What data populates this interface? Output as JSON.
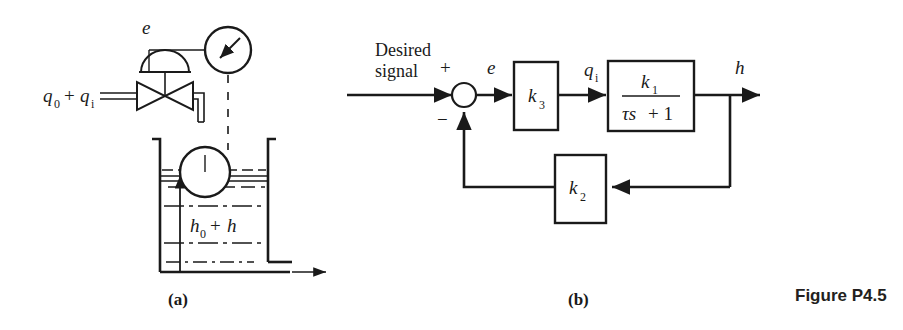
{
  "figure": {
    "caption": "Figure P4.5",
    "part_a_label": "(a)",
    "part_b_label": "(b)",
    "line_color": "#1a1a1a",
    "background_color": "#ffffff"
  },
  "schematic_a": {
    "name": "liquid-level-control-schematic",
    "inflow_label": "q",
    "inflow_sub_0": "0",
    "inflow_plus": "+",
    "inflow_label2": "q",
    "inflow_sub_i": "i",
    "error_label": "e",
    "height_label": "h",
    "height_sub_0": "0",
    "height_plus": "+",
    "height_label2": "h",
    "components": [
      "inflow-pipe",
      "control-valve",
      "diaphragm-actuator",
      "error-gauge",
      "linkage-dashed-line",
      "float-ball",
      "tank",
      "liquid-surface",
      "height-dimension-arrow",
      "outflow-pipe"
    ]
  },
  "block_diagram_b": {
    "name": "feedback-control-block-diagram",
    "input_label_line1": "Desired",
    "input_label_line2": "signal",
    "sum_plus": "+",
    "sum_minus": "−",
    "error_label": "e",
    "gain_k3": "k",
    "gain_k3_sub": "3",
    "flow_label": "q",
    "flow_label_sub": "i",
    "plant_numerator": "k",
    "plant_numerator_sub": "1",
    "plant_denominator_tau": "τs",
    "plant_denominator_rest": "+ 1",
    "output_label": "h",
    "feedback_k2": "k",
    "feedback_k2_sub": "2",
    "blocks": [
      {
        "name": "gain-block-k3",
        "label": "k3"
      },
      {
        "name": "plant-block-k1-over-tau-s-plus-1",
        "label": "k1/(τs+1)"
      },
      {
        "name": "feedback-gain-block-k2",
        "label": "k2"
      }
    ],
    "junctions": [
      {
        "name": "summing-junction",
        "signs": [
          "+",
          "−"
        ]
      }
    ]
  }
}
